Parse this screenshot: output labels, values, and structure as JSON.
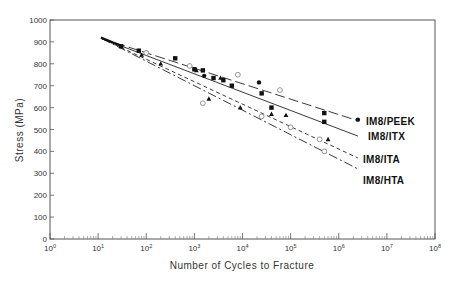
{
  "chart_data": {
    "type": "scatter",
    "title": "",
    "xlabel": "Number of Cycles to Fracture",
    "ylabel": "Stress (MPa)",
    "xscale": "log",
    "xlim": [
      1,
      100000000
    ],
    "ylim": [
      0,
      1000
    ],
    "x_ticks": [
      "10^0",
      "10^1",
      "10^2",
      "10^3",
      "10^4",
      "10^5",
      "10^6",
      "10^7",
      "10^8"
    ],
    "y_ticks": [
      0,
      100,
      200,
      300,
      400,
      500,
      600,
      700,
      800,
      900,
      1000
    ],
    "grid": false,
    "legend_position": "inline-right",
    "series": [
      {
        "name": "IM8/PEEK",
        "marker": "filled-circle",
        "line_style": "long-dash",
        "fit_line": [
          [
            12,
            915
          ],
          [
            2500000,
            540
          ]
        ],
        "points": [
          [
            1600,
            745
          ],
          [
            22000,
            715
          ],
          [
            2500000,
            545
          ]
        ]
      },
      {
        "name": "IM8/ITX",
        "marker": "filled-square",
        "line_style": "solid",
        "fit_line": [
          [
            12,
            915
          ],
          [
            2500000,
            470
          ]
        ],
        "points": [
          [
            30,
            880
          ],
          [
            70,
            860
          ],
          [
            400,
            825
          ],
          [
            1000,
            775
          ],
          [
            1500,
            770
          ],
          [
            2500,
            735
          ],
          [
            4000,
            725
          ],
          [
            6000,
            700
          ],
          [
            25000,
            665
          ],
          [
            40000,
            600
          ],
          [
            500000,
            575
          ],
          [
            500000,
            535
          ]
        ]
      },
      {
        "name": "IM8/ITA",
        "marker": "filled-triangle",
        "line_style": "short-dash",
        "fit_line": [
          [
            12,
            915
          ],
          [
            2500000,
            370
          ]
        ],
        "points": [
          [
            80,
            840
          ],
          [
            200,
            800
          ],
          [
            1100,
            770
          ],
          [
            2000,
            640
          ],
          [
            3500,
            735
          ],
          [
            9000,
            600
          ],
          [
            40000,
            570
          ],
          [
            80000,
            565
          ],
          [
            600000,
            455
          ]
        ]
      },
      {
        "name": "IM8/HTA",
        "marker": "open-circle",
        "line_style": "dash-dot",
        "fit_line": [
          [
            12,
            915
          ],
          [
            2500000,
            320
          ]
        ],
        "points": [
          [
            100,
            850
          ],
          [
            800,
            790
          ],
          [
            1500,
            620
          ],
          [
            8000,
            750
          ],
          [
            25000,
            560
          ],
          [
            60000,
            680
          ],
          [
            100000,
            510
          ],
          [
            400000,
            455
          ],
          [
            500000,
            400
          ]
        ]
      }
    ]
  }
}
